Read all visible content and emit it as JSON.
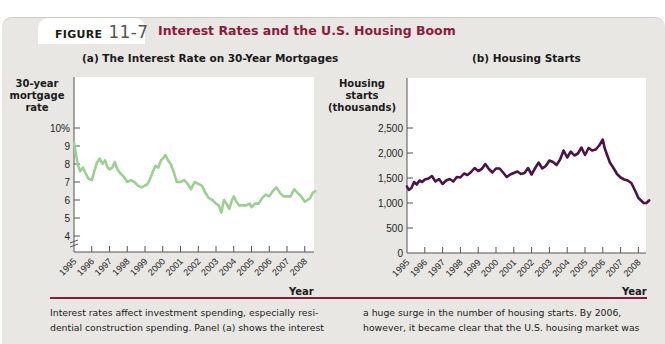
{
  "figure": {
    "label": "FIGURE",
    "number": "11-7",
    "title": "Interest Rates and the U.S. Housing Boom"
  },
  "colors": {
    "title": "#8c1a3e",
    "mortgage_line": "#9dcf93",
    "housing_line": "#4a1546",
    "rule": "#8c1a3e",
    "panel_bg": "#e9e7e3"
  },
  "panel_a": {
    "title": "(a) The Interest Rate on 30-Year Mortgages",
    "ylabel_lines": [
      "30-year",
      "mortgage",
      "rate"
    ],
    "xlabel": "Year"
  },
  "panel_b": {
    "title": "(b) Housing Starts",
    "ylabel_lines": [
      "Housing",
      "starts",
      "(thousands)"
    ],
    "xlabel": "Year"
  },
  "caption": {
    "left_lines": [
      "Interest rates affect investment spending, especially resi-",
      "dential construction spending. Panel (a) shows the interest"
    ],
    "right_lines": [
      "a huge surge in the number of housing starts. By 2006,",
      "however, it became clear that the U.S. housing market was"
    ]
  },
  "chart_data": [
    {
      "type": "line",
      "title": "(a) The Interest Rate on 30-Year Mortgages",
      "xlabel": "Year",
      "ylabel": "30-year mortgage rate",
      "x_ticks": [
        "1995",
        "1996",
        "1997",
        "1998",
        "1999",
        "2000",
        "2001",
        "2002",
        "2003",
        "2004",
        "2005",
        "2006",
        "2007",
        "2008"
      ],
      "y_ticks": [
        "4",
        "5",
        "6",
        "7",
        "8",
        "9",
        "10%"
      ],
      "ylim": [
        4,
        10
      ],
      "axis_break": true,
      "grid": false,
      "series": [
        {
          "name": "30-year mortgage rate",
          "x": [
            1995.0,
            1995.1,
            1995.2,
            1995.35,
            1995.5,
            1995.65,
            1995.8,
            1996.0,
            1996.15,
            1996.3,
            1996.45,
            1996.6,
            1996.75,
            1996.9,
            1997.0,
            1997.15,
            1997.3,
            1997.45,
            1997.6,
            1997.8,
            1998.0,
            1998.2,
            1998.4,
            1998.6,
            1998.8,
            1999.0,
            1999.15,
            1999.3,
            1999.45,
            1999.6,
            1999.75,
            1999.9,
            2000.0,
            2000.15,
            2000.3,
            2000.45,
            2000.6,
            2000.8,
            2001.0,
            2001.2,
            2001.4,
            2001.6,
            2001.8,
            2002.0,
            2002.2,
            2002.4,
            2002.6,
            2002.8,
            2003.0,
            2003.15,
            2003.3,
            2003.45,
            2003.6,
            2003.75,
            2003.9,
            2004.0,
            2004.15,
            2004.3,
            2004.5,
            2004.7,
            2004.9,
            2005.0,
            2005.2,
            2005.4,
            2005.6,
            2005.8,
            2006.0,
            2006.2,
            2006.4,
            2006.6,
            2006.8,
            2007.0,
            2007.2,
            2007.4,
            2007.6,
            2007.8,
            2008.0,
            2008.15,
            2008.3,
            2008.45,
            2008.6
          ],
          "values": [
            9.2,
            8.6,
            8.0,
            7.6,
            7.8,
            7.5,
            7.2,
            7.1,
            7.6,
            8.1,
            8.3,
            8.0,
            8.2,
            7.8,
            7.7,
            7.8,
            8.1,
            7.7,
            7.5,
            7.3,
            7.0,
            7.1,
            7.0,
            6.8,
            6.7,
            6.8,
            6.9,
            7.2,
            7.6,
            7.9,
            7.8,
            8.2,
            8.3,
            8.5,
            8.2,
            8.0,
            7.6,
            7.0,
            7.0,
            7.1,
            6.9,
            6.6,
            7.0,
            6.9,
            6.8,
            6.4,
            6.1,
            6.0,
            5.8,
            5.7,
            5.3,
            6.0,
            5.8,
            5.5,
            6.0,
            6.2,
            5.9,
            5.7,
            5.7,
            5.7,
            5.8,
            5.6,
            5.8,
            5.8,
            6.1,
            6.3,
            6.2,
            6.5,
            6.7,
            6.4,
            6.2,
            6.2,
            6.2,
            6.6,
            6.4,
            6.2,
            5.9,
            6.0,
            6.1,
            6.4,
            6.5
          ]
        }
      ]
    },
    {
      "type": "line",
      "title": "(b) Housing Starts",
      "xlabel": "Year",
      "ylabel": "Housing starts (thousands)",
      "x_ticks": [
        "1995",
        "1996",
        "1997",
        "1998",
        "1999",
        "2000",
        "2001",
        "2002",
        "2003",
        "2004",
        "2005",
        "2006",
        "2007",
        "2008"
      ],
      "y_ticks": [
        "0",
        "500",
        "1,000",
        "1,500",
        "2,000",
        "2,500"
      ],
      "ylim": [
        0,
        2500
      ],
      "grid": false,
      "series": [
        {
          "name": "Housing starts",
          "x": [
            1995.0,
            1995.1,
            1995.25,
            1995.4,
            1995.55,
            1995.7,
            1995.85,
            1996.0,
            1996.2,
            1996.4,
            1996.6,
            1996.8,
            1997.0,
            1997.2,
            1997.4,
            1997.6,
            1997.8,
            1998.0,
            1998.2,
            1998.4,
            1998.6,
            1998.8,
            1999.0,
            1999.2,
            1999.4,
            1999.6,
            1999.8,
            2000.0,
            2000.2,
            2000.4,
            2000.6,
            2000.8,
            2001.0,
            2001.2,
            2001.4,
            2001.6,
            2001.8,
            2002.0,
            2002.2,
            2002.4,
            2002.6,
            2002.8,
            2003.0,
            2003.2,
            2003.4,
            2003.6,
            2003.8,
            2004.0,
            2004.2,
            2004.4,
            2004.6,
            2004.8,
            2005.0,
            2005.2,
            2005.4,
            2005.6,
            2005.8,
            2006.0,
            2006.1,
            2006.25,
            2006.4,
            2006.6,
            2006.8,
            2007.0,
            2007.2,
            2007.4,
            2007.6,
            2007.8,
            2008.0,
            2008.15,
            2008.3,
            2008.45,
            2008.6
          ],
          "values": [
            1330,
            1260,
            1300,
            1420,
            1370,
            1450,
            1420,
            1470,
            1490,
            1540,
            1430,
            1480,
            1380,
            1450,
            1480,
            1430,
            1520,
            1510,
            1590,
            1560,
            1620,
            1700,
            1640,
            1680,
            1780,
            1680,
            1610,
            1690,
            1690,
            1610,
            1520,
            1570,
            1600,
            1630,
            1580,
            1600,
            1700,
            1570,
            1700,
            1810,
            1690,
            1740,
            1850,
            1820,
            1760,
            1870,
            2050,
            1910,
            2030,
            1950,
            1990,
            2110,
            1960,
            2100,
            2050,
            2070,
            2150,
            2270,
            2100,
            1950,
            1810,
            1700,
            1580,
            1510,
            1470,
            1450,
            1400,
            1260,
            1100,
            1050,
            1000,
            1000,
            1050
          ]
        }
      ]
    }
  ]
}
